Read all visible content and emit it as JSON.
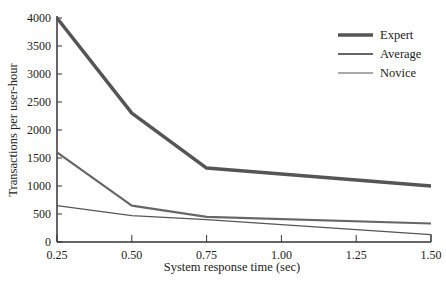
{
  "chart_data": {
    "type": "line",
    "title": "",
    "xlabel": "System response time (sec)",
    "ylabel": "Transactions per user-hour",
    "x": [
      0.25,
      0.5,
      0.75,
      1.5
    ],
    "xticks": [
      "0.25",
      "0.50",
      "0.75",
      "1.00",
      "1.25",
      "1.50"
    ],
    "yticks": [
      "0",
      "500",
      "1000",
      "1500",
      "2000",
      "2500",
      "3000",
      "3500",
      "4000"
    ],
    "ylim": [
      0,
      4000
    ],
    "xlim": [
      0.25,
      1.5
    ],
    "grid": false,
    "legend_position": "top-right",
    "series": [
      {
        "name": "Expert",
        "values": [
          4000,
          2300,
          1320,
          1000
        ]
      },
      {
        "name": "Average",
        "values": [
          1600,
          650,
          450,
          330
        ]
      },
      {
        "name": "Novice",
        "values": [
          650,
          470,
          400,
          130
        ]
      }
    ]
  }
}
